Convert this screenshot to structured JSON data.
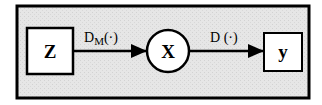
{
  "diagram": {
    "type": "flow",
    "nodes": [
      {
        "id": "Z",
        "label": "Z",
        "shape": "square"
      },
      {
        "id": "X",
        "label": "X",
        "shape": "circle"
      },
      {
        "id": "y",
        "label": "y",
        "shape": "square"
      }
    ],
    "edges": [
      {
        "from": "Z",
        "to": "X",
        "label_main": "D",
        "label_sub": "M",
        "label_args": "(·)"
      },
      {
        "from": "X",
        "to": "y",
        "label_main": "D",
        "label_sub": "",
        "label_args": " (·)"
      }
    ],
    "colors": {
      "frame_fill": "#e4e4e4",
      "stroke": "#000000",
      "node_fill": "#ffffff"
    }
  }
}
